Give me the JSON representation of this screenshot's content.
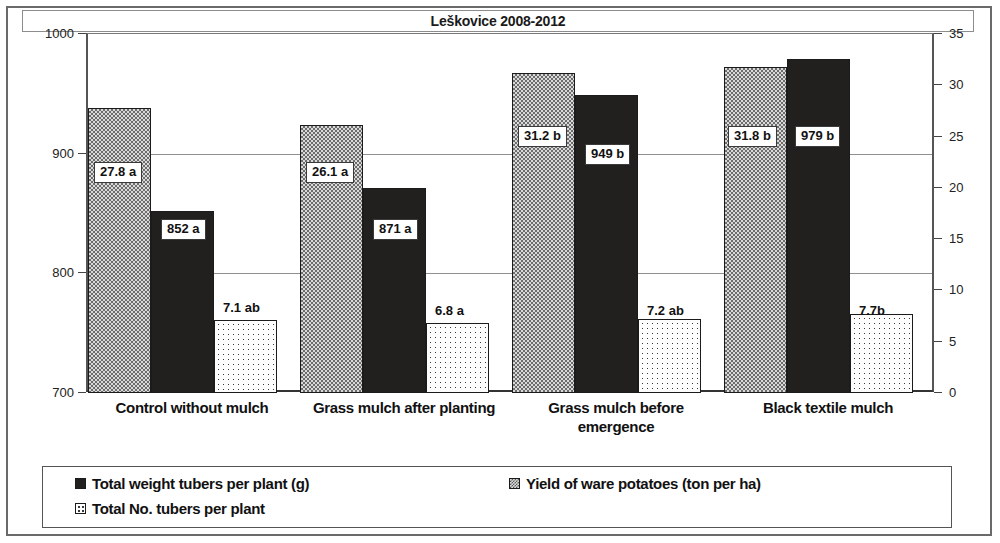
{
  "chart_data": {
    "type": "bar",
    "title": "Leškovice 2008-2012",
    "xlabel": "",
    "ylabel": "",
    "grid": true,
    "legend_position": "bottom",
    "categories": [
      "Control without mulch",
      "Grass mulch after planting",
      "Grass mulch before emergence",
      "Black textile mulch"
    ],
    "axes": {
      "left": {
        "label": "",
        "min": 700,
        "max": 1000,
        "ticks": [
          "700",
          "800",
          "900",
          "1000"
        ],
        "tick_values": [
          700,
          800,
          900,
          1000
        ]
      },
      "right": {
        "label": "",
        "min": 0,
        "max": 35,
        "ticks": [
          "0",
          "5",
          "10",
          "15",
          "20",
          "25",
          "30",
          "35"
        ],
        "tick_values": [
          0,
          5,
          10,
          15,
          20,
          25,
          30,
          35
        ]
      }
    },
    "series": [
      {
        "name": "Yield of ware potatoes (ton per ha)",
        "axis": "right",
        "pattern": "checker",
        "values": [
          27.8,
          26.1,
          31.2,
          31.8
        ],
        "labels": [
          "27.8 a",
          "26.1 a",
          "31.2 b",
          "31.8 b"
        ]
      },
      {
        "name": "Total weight tubers per plant (g)",
        "axis": "left",
        "pattern": "solid",
        "values": [
          852,
          871,
          949,
          979
        ],
        "labels": [
          "852 a",
          "871 a",
          "949 b",
          "979 b"
        ]
      },
      {
        "name": "Total No. tubers per plant",
        "axis": "right",
        "pattern": "dots",
        "values": [
          7.1,
          6.8,
          7.2,
          7.7
        ],
        "labels": [
          "7.1 ab",
          "6.8 a",
          "7.2 ab",
          "7.7b"
        ]
      }
    ]
  },
  "legend": {
    "entries": [
      {
        "label": "Total weight tubers per plant (g)",
        "swatch": "solid-square-icon"
      },
      {
        "label": "Yield of ware potatoes (ton per ha)",
        "swatch": "checker-square-icon"
      },
      {
        "label": "Total No. tubers per plant",
        "swatch": "dotted-square-icon"
      }
    ]
  },
  "colors": {
    "bar_solid": "#221f1f",
    "bar_checker": "#6d6d6d",
    "bar_dots": "#fdfdfd",
    "frame": "#6a6a6a",
    "text": "#111111"
  }
}
